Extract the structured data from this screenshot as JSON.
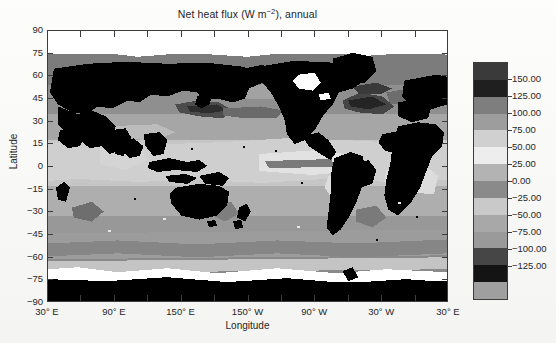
{
  "figure": {
    "title_main": "Net heat flux (W m",
    "title_exponent": "−2",
    "title_tail": "), annual",
    "title_full": "Net heat flux (W m−2), annual",
    "background_color": "#fbfbfa",
    "frame_color": "#3c3c3c"
  },
  "axes": {
    "x": {
      "label": "Longitude",
      "tick_labels": [
        "30° E",
        "90° E",
        "150° E",
        "150° W",
        "90° W",
        "30° W",
        "30° E"
      ],
      "tick_values": [
        30,
        90,
        150,
        210,
        270,
        330,
        390
      ],
      "minor_tick_step_deg": 30,
      "range": [
        30,
        390
      ]
    },
    "y": {
      "label": "Latitude",
      "tick_labels": [
        "90",
        "75",
        "60",
        "45",
        "30",
        "15",
        "0",
        "−15",
        "−30",
        "−45",
        "−60",
        "−75",
        "−90"
      ],
      "tick_values": [
        90,
        75,
        60,
        45,
        30,
        15,
        0,
        -15,
        -30,
        -45,
        -60,
        -75,
        -90
      ],
      "range": [
        -90,
        90
      ]
    }
  },
  "colorbar": {
    "unit": "W m−2",
    "labels": [
      "150.00",
      "125.00",
      "100.00",
      "75.00",
      "50.00",
      "25.00",
      "0.00",
      "−25.00",
      "−50.00",
      "−75.00",
      "−100.00",
      "−125.00"
    ],
    "values": [
      150,
      125,
      100,
      75,
      50,
      25,
      0,
      -25,
      -50,
      -75,
      -100,
      -125
    ],
    "segment_colors": [
      "#3a3a3a",
      "#1f1f1f",
      "#7e7e7e",
      "#9d9d9d",
      "#d0d0d0",
      "#ededed",
      "#b3b3b3",
      "#8a8a8a",
      "#c9c9c9",
      "#a8a8a8",
      "#9a9a9a",
      "#464646",
      "#141414",
      "#9f9f9f"
    ]
  },
  "chart_data": {
    "type": "heatmap",
    "title": "Net heat flux (W m−2), annual",
    "xlabel": "Longitude",
    "ylabel": "Latitude",
    "xlim": [
      30,
      390
    ],
    "ylim": [
      -90,
      90
    ],
    "grid": false,
    "legend_position": "right",
    "colorbar_label": "W m−2",
    "colorbar_ticks": [
      150,
      125,
      100,
      75,
      50,
      25,
      0,
      -25,
      -50,
      -75,
      -100,
      -125
    ],
    "colormap": "grayscale",
    "masked_regions": [
      "land (black)",
      "sea ice / polar (white)"
    ],
    "notes": [
      "Global map of annual mean net surface heat flux over the ocean",
      "Land masses rendered solid black; Antarctica and high-latitude ice rendered white",
      "Strong negative flux (ocean heat loss) along Gulf Stream and Kuroshio western boundary currents",
      "Positive flux (ocean heat gain) across the eastern tropical Pacific and Atlantic upwelling regions"
    ],
    "regions": [
      {
        "name": "Eastern equatorial Pacific",
        "approx_lon": 250,
        "approx_lat": 0,
        "value": 75
      },
      {
        "name": "Gulf Stream (NW Atlantic)",
        "approx_lon": 300,
        "approx_lat": 38,
        "value": -125
      },
      {
        "name": "Kuroshio (NW Pacific)",
        "approx_lon": 145,
        "approx_lat": 35,
        "value": -100
      },
      {
        "name": "Arabian Sea",
        "approx_lon": 65,
        "approx_lat": 15,
        "value": 25
      },
      {
        "name": "Southern Ocean (40-55S)",
        "approx_lon": 180,
        "approx_lat": -48,
        "value": -25
      },
      {
        "name": "Peru upwelling",
        "approx_lon": 278,
        "approx_lat": -12,
        "value": 75
      },
      {
        "name": "Benguela upwelling",
        "approx_lon": 8,
        "approx_lat": -20,
        "value": 50
      },
      {
        "name": "Subtropical South Indian",
        "approx_lon": 80,
        "approx_lat": -25,
        "value": 25
      }
    ]
  }
}
